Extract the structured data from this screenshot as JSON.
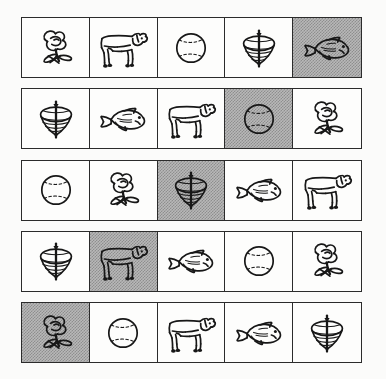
{
  "worksheet": {
    "title": "Picture Sequence Grid",
    "description": "Five rows of five hand-drawn picture cards; one card in each row is shaded gray.",
    "background_color": "#fbfbfa",
    "cell_background": "#fdfdfc",
    "shaded_color": "#b8b8b8",
    "ink_color": "#171717",
    "columns": 5,
    "rows": 5
  },
  "legend": {
    "symbols": [
      {
        "key": "flower",
        "label": "flower",
        "icon": "flower-icon"
      },
      {
        "key": "cow",
        "label": "cow",
        "icon": "cow-icon"
      },
      {
        "key": "ball",
        "label": "ball",
        "icon": "ball-icon"
      },
      {
        "key": "top",
        "label": "spinning top",
        "icon": "spinning-top-icon"
      },
      {
        "key": "fish",
        "label": "fish",
        "icon": "fish-icon"
      }
    ]
  },
  "grid": {
    "rows": [
      {
        "index": 1,
        "cells": [
          {
            "symbol": "flower",
            "label": "flower",
            "shaded": false
          },
          {
            "symbol": "cow",
            "label": "cow",
            "shaded": false
          },
          {
            "symbol": "ball",
            "label": "ball",
            "shaded": false
          },
          {
            "symbol": "top",
            "label": "spinning top",
            "shaded": false
          },
          {
            "symbol": "fish",
            "label": "fish",
            "shaded": true
          }
        ]
      },
      {
        "index": 2,
        "cells": [
          {
            "symbol": "top",
            "label": "spinning top",
            "shaded": false
          },
          {
            "symbol": "fish",
            "label": "fish",
            "shaded": false
          },
          {
            "symbol": "cow",
            "label": "cow",
            "shaded": false
          },
          {
            "symbol": "ball",
            "label": "ball",
            "shaded": true
          },
          {
            "symbol": "flower",
            "label": "flower",
            "shaded": false
          }
        ]
      },
      {
        "index": 3,
        "cells": [
          {
            "symbol": "ball",
            "label": "ball",
            "shaded": false
          },
          {
            "symbol": "flower",
            "label": "flower",
            "shaded": false
          },
          {
            "symbol": "top",
            "label": "spinning top",
            "shaded": true
          },
          {
            "symbol": "fish",
            "label": "fish",
            "shaded": false
          },
          {
            "symbol": "cow",
            "label": "cow",
            "shaded": false
          }
        ]
      },
      {
        "index": 4,
        "cells": [
          {
            "symbol": "top",
            "label": "spinning top",
            "shaded": false
          },
          {
            "symbol": "cow",
            "label": "cow",
            "shaded": true
          },
          {
            "symbol": "fish",
            "label": "fish",
            "shaded": false
          },
          {
            "symbol": "ball",
            "label": "ball",
            "shaded": false
          },
          {
            "symbol": "flower",
            "label": "flower",
            "shaded": false
          }
        ]
      },
      {
        "index": 5,
        "cells": [
          {
            "symbol": "flower",
            "label": "flower",
            "shaded": true
          },
          {
            "symbol": "ball",
            "label": "ball",
            "shaded": false
          },
          {
            "symbol": "cow",
            "label": "cow",
            "shaded": false
          },
          {
            "symbol": "fish",
            "label": "fish",
            "shaded": false
          },
          {
            "symbol": "top",
            "label": "spinning top",
            "shaded": false
          }
        ]
      }
    ]
  }
}
